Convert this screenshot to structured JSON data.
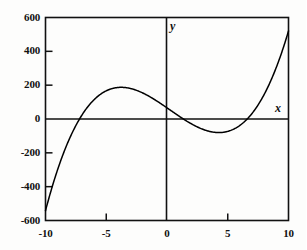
{
  "chart_data": {
    "type": "line",
    "title": "",
    "subtitle": "",
    "xlabel": "x",
    "ylabel": "y",
    "xlim": [
      -10,
      10
    ],
    "ylim": [
      -600,
      600
    ],
    "grid": false,
    "legend": null,
    "xticks": [
      {
        "value": -10,
        "label": "-10"
      },
      {
        "value": -5,
        "label": "-5"
      },
      {
        "value": 0,
        "label": "0"
      },
      {
        "value": 5,
        "label": "5"
      },
      {
        "value": 10,
        "label": "10"
      }
    ],
    "yticks": [
      {
        "value": 600,
        "label": "600"
      },
      {
        "value": 400,
        "label": "400"
      },
      {
        "value": 200,
        "label": "200"
      },
      {
        "value": 0,
        "label": "0"
      },
      {
        "value": -200,
        "label": "-200"
      },
      {
        "value": -400,
        "label": "-400"
      },
      {
        "value": -600,
        "label": "-600"
      }
    ],
    "series": [
      {
        "name": "cubic",
        "color": "#000000",
        "linewidth": 1.4,
        "x": [
          -10.0,
          -9.5,
          -9.0,
          -8.5,
          -8.0,
          -7.5,
          -7.0,
          -6.5,
          -6.0,
          -5.5,
          -5.0,
          -4.5,
          -4.0,
          -3.5,
          -3.0,
          -2.5,
          -2.0,
          -1.5,
          -1.0,
          -0.5,
          0.0,
          0.5,
          1.0,
          1.5,
          2.0,
          2.5,
          3.0,
          3.5,
          4.0,
          4.5,
          5.0,
          5.5,
          6.0,
          6.5,
          7.0,
          7.5,
          8.0,
          8.5,
          9.0,
          9.5,
          10.0
        ],
        "y": [
          -560,
          -484,
          -412,
          -344,
          -280,
          -220,
          -164,
          -112,
          -64,
          -20,
          20,
          56,
          88,
          116,
          140,
          160,
          176,
          188,
          196,
          200,
          200,
          196,
          188,
          176,
          160,
          140,
          116,
          88,
          56,
          20,
          -20,
          -64,
          -112,
          -164,
          -220,
          -280,
          -344,
          -412,
          -484,
          -560,
          -640
        ]
      }
    ],
    "curve_features": {
      "local_maximum": {
        "x": -3.8,
        "y": 180
      },
      "local_minimum": {
        "x": 4.0,
        "y": -60
      },
      "roots": [
        -7.2,
        1.35,
        6.6
      ],
      "endpoint_left": {
        "x": -10,
        "y": -560
      },
      "endpoint_right": {
        "x": 10,
        "y": 520
      }
    },
    "axis_labels": {
      "x_axis_name": "x",
      "y_axis_name": "y"
    }
  }
}
